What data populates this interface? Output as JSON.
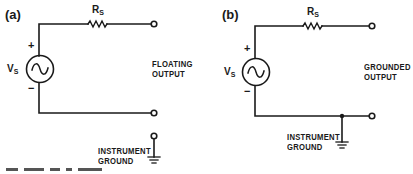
{
  "figure": {
    "panels": [
      {
        "id": "a",
        "label": "(a)",
        "source_label": "V",
        "source_sub": "S",
        "resistor_label": "R",
        "resistor_sub": "S",
        "plus": "+",
        "minus": "−",
        "output_label_line1": "FLOATING",
        "output_label_line2": "OUTPUT",
        "ground_label_line1": "INSTRUMENT",
        "ground_label_line2": "GROUND"
      },
      {
        "id": "b",
        "label": "(b)",
        "source_label": "V",
        "source_sub": "S",
        "resistor_label": "R",
        "resistor_sub": "S",
        "plus": "+",
        "minus": "−",
        "output_label_line1": "GROUNDED",
        "output_label_line2": "OUTPUT",
        "ground_label_line1": "INSTRUMENT",
        "ground_label_line2": "GROUND"
      }
    ],
    "colors": {
      "ink": "#1a1a1a",
      "background": "#ffffff"
    }
  }
}
